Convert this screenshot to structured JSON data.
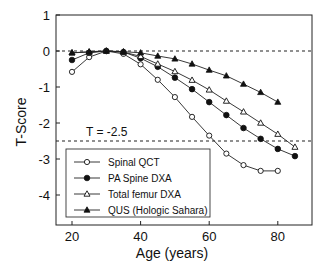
{
  "chart_data": {
    "type": "line",
    "title": "",
    "xlabel": "Age (years)",
    "ylabel": "T-Score",
    "xlim": [
      15,
      90
    ],
    "ylim": [
      -5,
      1
    ],
    "xticks": [
      20,
      40,
      60,
      80
    ],
    "yticks": [
      1,
      0,
      -1,
      -2,
      -3,
      -4
    ],
    "grid": false,
    "legend_position": "lower left",
    "reference_lines": [
      {
        "y": 0,
        "style": "dashed"
      },
      {
        "y": -2.5,
        "style": "dashed",
        "label": "T = -2.5"
      }
    ],
    "series": [
      {
        "name": "Spinal QCT",
        "marker": "open-circle",
        "x": [
          20,
          25,
          30,
          35,
          40,
          45,
          50,
          55,
          60,
          65,
          70,
          75,
          80
        ],
        "y": [
          -0.58,
          -0.17,
          0.0,
          -0.08,
          -0.37,
          -0.8,
          -1.28,
          -1.83,
          -2.35,
          -2.85,
          -3.17,
          -3.33,
          -3.33
        ]
      },
      {
        "name": "PA Spine DXA",
        "marker": "filled-circle",
        "x": [
          20,
          25,
          30,
          35,
          40,
          45,
          50,
          55,
          60,
          65,
          70,
          75,
          80,
          85
        ],
        "y": [
          -0.25,
          -0.05,
          0.0,
          -0.03,
          -0.2,
          -0.44,
          -0.74,
          -1.06,
          -1.42,
          -1.78,
          -2.14,
          -2.44,
          -2.72,
          -2.92
        ]
      },
      {
        "name": "Total femur DXA",
        "marker": "open-triangle",
        "x": [
          20,
          25,
          30,
          35,
          40,
          45,
          50,
          55,
          60,
          65,
          70,
          75,
          80,
          85
        ],
        "y": [
          -0.05,
          -0.03,
          0.0,
          -0.03,
          -0.15,
          -0.36,
          -0.57,
          -0.81,
          -1.08,
          -1.39,
          -1.69,
          -2.0,
          -2.31,
          -2.67
        ]
      },
      {
        "name": "QUS (Hologic Sahara)",
        "marker": "filled-triangle",
        "x": [
          20,
          25,
          30,
          35,
          40,
          45,
          50,
          55,
          60,
          65,
          70,
          75,
          80
        ],
        "y": [
          -0.05,
          -0.02,
          0.0,
          -0.02,
          -0.05,
          -0.14,
          -0.22,
          -0.36,
          -0.53,
          -0.69,
          -0.92,
          -1.15,
          -1.42
        ]
      }
    ]
  },
  "annotations": {
    "threshold_label": "T = -2.5"
  }
}
